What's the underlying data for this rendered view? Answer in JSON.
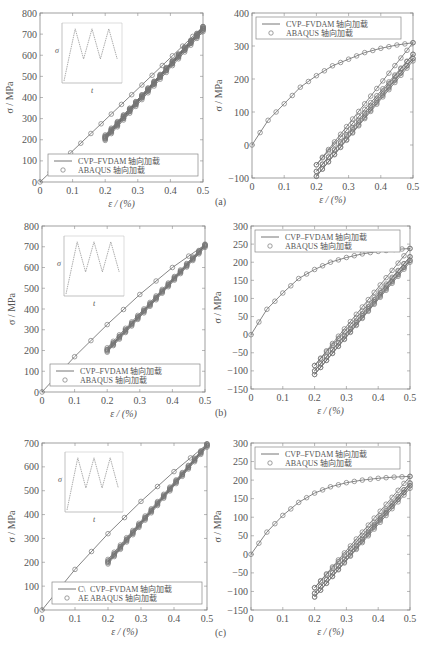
{
  "figure": {
    "panel_labels": [
      "(a)",
      "(b)",
      "(c)"
    ],
    "legend": {
      "line_label": "CVP–FVDAM 轴向加载",
      "marker_label": "ABAQUS 轴向加载",
      "truncated_line_prefix": "C\\",
      "truncated_marker_prefix": "AE"
    },
    "inset": {
      "ylabel": "σ",
      "xlabel": "t"
    }
  },
  "chart_data": [
    {
      "id": "a-left",
      "type": "line",
      "xlabel": "ε / (%)",
      "ylabel": "σ / MPa",
      "xlim": [
        0,
        0.5
      ],
      "ylim": [
        0,
        800
      ],
      "xticks": [
        "0",
        "0.1",
        "0.2",
        "0.3",
        "0.4",
        "0.5"
      ],
      "yticks": [
        "0",
        "100",
        "200",
        "300",
        "400",
        "500",
        "600",
        "700",
        "800"
      ],
      "legend_position": "lower right",
      "grid": false,
      "series": [
        {
          "name": "CVP–FVDAM 轴向加载",
          "style": "line",
          "segments": [
            [
              [
                0,
                0
              ],
              [
                0.5,
                735
              ]
            ],
            [
              [
                0.2,
                205
              ],
              [
                0.5,
                720
              ]
            ],
            [
              [
                0.5,
                720
              ],
              [
                0.2,
                215
              ]
            ],
            [
              [
                0.2,
                215
              ],
              [
                0.5,
                728
              ]
            ],
            [
              [
                0.5,
                728
              ],
              [
                0.2,
                210
              ]
            ],
            [
              [
                0.2,
                210
              ],
              [
                0.5,
                735
              ]
            ]
          ]
        },
        {
          "name": "ABAQUS 轴向加载",
          "style": "circle-markers",
          "note": "markers along the same paths"
        }
      ],
      "inset": "triangular load history (σ vs t), 3 cycles"
    },
    {
      "id": "a-right",
      "type": "line",
      "panel_label": "(a)",
      "xlabel": "ε / (%)",
      "ylabel": "σ / MPa",
      "xlim": [
        0,
        0.5
      ],
      "ylim": [
        -100,
        400
      ],
      "xticks": [
        "0",
        "0.1",
        "0.2",
        "0.3",
        "0.4",
        "0.5"
      ],
      "yticks": [
        "-100",
        "0",
        "100",
        "200",
        "300",
        "400"
      ],
      "legend_position": "upper left",
      "grid": false,
      "series": [
        {
          "name": "CVP–FVDAM 轴向加载",
          "style": "line",
          "monotonic": [
            [
              0,
              0
            ],
            [
              0.05,
              75
            ],
            [
              0.1,
              125
            ],
            [
              0.15,
              175
            ],
            [
              0.2,
              210
            ],
            [
              0.25,
              240
            ],
            [
              0.3,
              260
            ],
            [
              0.35,
              280
            ],
            [
              0.4,
              293
            ],
            [
              0.45,
              303
            ],
            [
              0.5,
              310
            ]
          ],
          "loops": [
            [
              [
                0.5,
                310
              ],
              [
                0.2,
                -60
              ]
            ],
            [
              [
                0.2,
                -60
              ],
              [
                0.5,
                275
              ]
            ],
            [
              [
                0.5,
                275
              ],
              [
                0.2,
                -80
              ]
            ],
            [
              [
                0.2,
                -80
              ],
              [
                0.5,
                262
              ]
            ],
            [
              [
                0.5,
                262
              ],
              [
                0.2,
                -95
              ]
            ],
            [
              [
                0.2,
                -95
              ],
              [
                0.5,
                255
              ]
            ]
          ]
        },
        {
          "name": "ABAQUS 轴向加载",
          "style": "circle-markers"
        }
      ]
    },
    {
      "id": "b-left",
      "type": "line",
      "xlabel": "ε / (%)",
      "ylabel": "σ / MPa",
      "xlim": [
        0,
        0.5
      ],
      "ylim": [
        0,
        800
      ],
      "xticks": [
        "0",
        "0.1",
        "0.2",
        "0.3",
        "0.4",
        "0.5"
      ],
      "yticks": [
        "0",
        "100",
        "200",
        "300",
        "400",
        "500",
        "600",
        "700",
        "800"
      ],
      "legend_position": "lower right",
      "grid": false,
      "series": [
        {
          "name": "CVP–FVDAM 轴向加载",
          "style": "line",
          "segments": [
            [
              [
                0,
                0
              ],
              [
                0.1,
                170
              ],
              [
                0.2,
                325
              ],
              [
                0.3,
                470
              ],
              [
                0.4,
                600
              ],
              [
                0.5,
                710
              ]
            ],
            [
              [
                0.2,
                200
              ],
              [
                0.5,
                705
              ]
            ],
            [
              [
                0.5,
                705
              ],
              [
                0.2,
                205
              ]
            ],
            [
              [
                0.2,
                205
              ],
              [
                0.5,
                710
              ]
            ]
          ]
        },
        {
          "name": "ABAQUS 轴向加载",
          "style": "circle-markers"
        }
      ],
      "inset": "triangular load history (σ vs t), 3 cycles"
    },
    {
      "id": "b-right",
      "type": "line",
      "panel_label": "(b)",
      "xlabel": "ε / (%)",
      "ylabel": "σ / MPa",
      "xlim": [
        0,
        0.5
      ],
      "ylim": [
        -150,
        300
      ],
      "xticks": [
        "0",
        "0.1",
        "0.2",
        "0.3",
        "0.4",
        "0.5"
      ],
      "yticks": [
        "-150",
        "-100",
        "-50",
        "0",
        "50",
        "100",
        "150",
        "200",
        "250",
        "300"
      ],
      "legend_position": "upper left",
      "grid": false,
      "series": [
        {
          "name": "CVP–FVDAM 轴向加载",
          "style": "line",
          "monotonic": [
            [
              0,
              0
            ],
            [
              0.05,
              70
            ],
            [
              0.1,
              115
            ],
            [
              0.15,
              155
            ],
            [
              0.2,
              180
            ],
            [
              0.25,
              200
            ],
            [
              0.3,
              213
            ],
            [
              0.35,
              223
            ],
            [
              0.4,
              230
            ],
            [
              0.45,
              235
            ],
            [
              0.5,
              238
            ]
          ],
          "loops": [
            [
              [
                0.5,
                238
              ],
              [
                0.2,
                -85
              ]
            ],
            [
              [
                0.2,
                -85
              ],
              [
                0.5,
                215
              ]
            ],
            [
              [
                0.5,
                215
              ],
              [
                0.2,
                -100
              ]
            ],
            [
              [
                0.2,
                -100
              ],
              [
                0.5,
                205
              ]
            ],
            [
              [
                0.5,
                205
              ],
              [
                0.2,
                -110
              ]
            ],
            [
              [
                0.2,
                -110
              ],
              [
                0.5,
                200
              ]
            ]
          ]
        },
        {
          "name": "ABAQUS 轴向加载",
          "style": "circle-markers"
        }
      ]
    },
    {
      "id": "c-left",
      "type": "line",
      "xlabel": "ε / (%)",
      "ylabel": "σ / MPa",
      "xlim": [
        0,
        0.5
      ],
      "ylim": [
        0,
        700
      ],
      "xticks": [
        "0",
        "0.1",
        "0.2",
        "0.3",
        "0.4",
        "0.5"
      ],
      "yticks": [
        "0",
        "100",
        "200",
        "300",
        "400",
        "500",
        "600",
        "700"
      ],
      "legend_position": "lower right",
      "grid": false,
      "series": [
        {
          "name": "CVP–FVDAM 轴向加载",
          "style": "line",
          "segments": [
            [
              [
                0,
                0
              ],
              [
                0.1,
                170
              ],
              [
                0.2,
                320
              ],
              [
                0.3,
                455
              ],
              [
                0.4,
                580
              ],
              [
                0.5,
                695
              ]
            ],
            [
              [
                0.2,
                200
              ],
              [
                0.5,
                690
              ]
            ],
            [
              [
                0.5,
                690
              ],
              [
                0.2,
                205
              ]
            ],
            [
              [
                0.2,
                205
              ],
              [
                0.5,
                695
              ]
            ]
          ]
        },
        {
          "name": "ABAQUS 轴向加载",
          "style": "circle-markers"
        }
      ],
      "inset": "triangular load history (σ vs t), 3 cycles"
    },
    {
      "id": "c-right",
      "type": "line",
      "panel_label": "(c)",
      "xlabel": "ε / (%)",
      "ylabel": "σ / MPa",
      "xlim": [
        0,
        0.5
      ],
      "ylim": [
        -150,
        300
      ],
      "xticks": [
        "0",
        "0.1",
        "0.2",
        "0.3",
        "0.4",
        "0.5"
      ],
      "yticks": [
        "-150",
        "-100",
        "-50",
        "0",
        "50",
        "100",
        "150",
        "200",
        "250",
        "300"
      ],
      "legend_position": "upper left",
      "grid": false,
      "series": [
        {
          "name": "CVP–FVDAM 轴向加载",
          "style": "line",
          "monotonic": [
            [
              0,
              0
            ],
            [
              0.05,
              60
            ],
            [
              0.1,
              105
            ],
            [
              0.15,
              140
            ],
            [
              0.2,
              165
            ],
            [
              0.25,
              182
            ],
            [
              0.3,
              193
            ],
            [
              0.35,
              200
            ],
            [
              0.4,
              205
            ],
            [
              0.45,
              208
            ],
            [
              0.5,
              210
            ]
          ],
          "loops": [
            [
              [
                0.5,
                210
              ],
              [
                0.2,
                -90
              ]
            ],
            [
              [
                0.2,
                -90
              ],
              [
                0.5,
                192
              ]
            ],
            [
              [
                0.5,
                192
              ],
              [
                0.2,
                -105
              ]
            ],
            [
              [
                0.2,
                -105
              ],
              [
                0.5,
                185
              ]
            ],
            [
              [
                0.5,
                185
              ],
              [
                0.2,
                -115
              ]
            ],
            [
              [
                0.2,
                -115
              ],
              [
                0.5,
                178
              ]
            ]
          ]
        },
        {
          "name": "ABAQUS 轴向加载",
          "style": "circle-markers"
        }
      ]
    }
  ]
}
